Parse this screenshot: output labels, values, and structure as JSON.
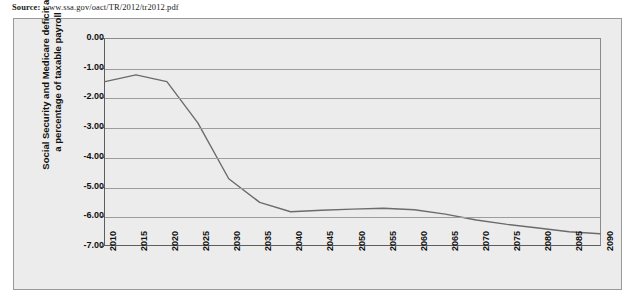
{
  "source": {
    "label": "Source:",
    "url": "www.ssa.gov/oact/TR/2012/tr2012.pdf"
  },
  "colors": {
    "plot_background": "#ececec",
    "gridline": "#9d9d9d",
    "axis": "#5d5d5d",
    "series_line": "#6b6b6b",
    "text": "#111111",
    "frame_border": "#9a9a9a"
  },
  "chart_data": {
    "type": "line",
    "title": "",
    "xlabel": "",
    "ylabel": "Social Security and Medicare deficit as a percentage of taxable payroll",
    "ylabel_lines": [
      "Social Security and Medicare deficit as",
      "a percentage of taxable payroll"
    ],
    "ylim": [
      -7.0,
      0.0
    ],
    "yticks": [
      0.0,
      -1.0,
      -2.0,
      -3.0,
      -4.0,
      -5.0,
      -6.0,
      -7.0
    ],
    "ytick_labels": [
      "0.00",
      "-1.00",
      "-2.00",
      "-3.00",
      "-4.00",
      "-5.00",
      "-6.00",
      "-7.00"
    ],
    "xlim": [
      2010,
      2090
    ],
    "xticks": [
      2010,
      2015,
      2020,
      2025,
      2030,
      2035,
      2040,
      2045,
      2050,
      2055,
      2060,
      2065,
      2070,
      2075,
      2080,
      2085,
      2090
    ],
    "xtick_labels": [
      "2010",
      "2015",
      "2020",
      "2025",
      "2030",
      "2035",
      "2040",
      "2045",
      "2050",
      "2055",
      "2060",
      "2065",
      "2070",
      "2075",
      "2080",
      "2085",
      "2090"
    ],
    "grid": true,
    "legend": false,
    "legend_position": "none",
    "series": [
      {
        "name": "Social Security and Medicare deficit",
        "x": [
          2010,
          2015,
          2020,
          2025,
          2030,
          2035,
          2040,
          2045,
          2050,
          2055,
          2060,
          2065,
          2070,
          2075,
          2080,
          2085,
          2090
        ],
        "values": [
          -1.45,
          -1.22,
          -1.45,
          -2.85,
          -4.75,
          -5.55,
          -5.87,
          -5.82,
          -5.78,
          -5.75,
          -5.8,
          -5.95,
          -6.15,
          -6.3,
          -6.42,
          -6.55,
          -6.62
        ]
      }
    ]
  }
}
